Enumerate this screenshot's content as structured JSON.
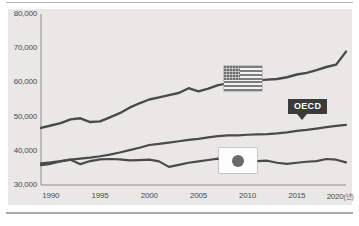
{
  "chart_data": {
    "type": "line",
    "title": "",
    "subtitle": "",
    "xlabel": "",
    "ylabel": "",
    "xunit": "(년)",
    "xlim": [
      1989,
      2020
    ],
    "ylim": [
      30000,
      80000
    ],
    "yticks": [
      "30,000",
      "40,000",
      "50,000",
      "60,000",
      "70,000",
      "80,000"
    ],
    "ytick_values": [
      30000,
      40000,
      50000,
      60000,
      70000,
      80000
    ],
    "xticks": [
      "1990",
      "1995",
      "2000",
      "2005",
      "2010",
      "2015",
      "2020"
    ],
    "xtick_values": [
      1990,
      1995,
      2000,
      2005,
      2010,
      2015,
      2020
    ],
    "grid": false,
    "legend_position": "inline-badges",
    "x": [
      1989,
      1990,
      1991,
      1992,
      1993,
      1994,
      1995,
      1996,
      1997,
      1998,
      1999,
      2000,
      2001,
      2002,
      2003,
      2004,
      2005,
      2006,
      2007,
      2008,
      2009,
      2010,
      2011,
      2012,
      2013,
      2014,
      2015,
      2016,
      2017,
      2018,
      2019,
      2020
    ],
    "series": [
      {
        "name": "USA",
        "label": "usa-flag",
        "color": "#4a4a4a",
        "values": [
          46700,
          47400,
          48100,
          49200,
          49500,
          48400,
          48600,
          49800,
          51000,
          52600,
          53900,
          55000,
          55600,
          56300,
          56900,
          58300,
          57400,
          58200,
          59200,
          59700,
          60200,
          60500,
          60600,
          60800,
          61000,
          61500,
          62300,
          62800,
          63600,
          64500,
          65200,
          69000
        ]
      },
      {
        "name": "OECD",
        "label": "OECD",
        "color": "#4a4a4a",
        "values": [
          36300,
          36600,
          37000,
          37400,
          37700,
          38000,
          38400,
          38900,
          39500,
          40200,
          40900,
          41700,
          42000,
          42400,
          42800,
          43200,
          43500,
          43900,
          44300,
          44500,
          44500,
          44700,
          44800,
          44900,
          45100,
          45400,
          45800,
          46100,
          46500,
          46900,
          47300,
          47600
        ]
      },
      {
        "name": "Japan",
        "label": "japan-flag",
        "color": "#4a4a4a",
        "values": [
          35800,
          36200,
          36900,
          37400,
          36100,
          37000,
          37500,
          37600,
          37500,
          37200,
          37300,
          37400,
          36900,
          35300,
          35900,
          36500,
          36900,
          37300,
          37700,
          37300,
          36700,
          37100,
          37000,
          37100,
          36500,
          36200,
          36500,
          36800,
          37000,
          37600,
          37400,
          36600
        ]
      }
    ]
  },
  "annotations": {
    "oecd_label": "OECD",
    "usa_badge": "usa-flag",
    "japan_badge": "japan-flag"
  }
}
